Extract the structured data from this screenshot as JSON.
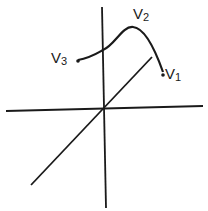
{
  "diagram": {
    "type": "3d-axes-with-curve",
    "labels": {
      "v1": {
        "main": "V",
        "sub": "1"
      },
      "v2": {
        "main": "V",
        "sub": "2"
      },
      "v3": {
        "main": "V",
        "sub": "3"
      }
    },
    "colors": {
      "stroke": "#1a1a1a",
      "background": "#ffffff"
    }
  }
}
